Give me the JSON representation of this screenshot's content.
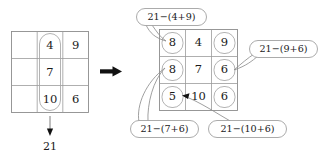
{
  "figure": {
    "target_sum": "21",
    "transition_icon": "right-arrow-icon",
    "colors": {
      "grid_line": "#9a9a9a",
      "oval": "#a5a5a5",
      "bubble": "#9c9c9c",
      "text": "#1a1a1a",
      "arrow": "#111111",
      "background": "#ffffff"
    }
  },
  "left_grid": {
    "rows": 3,
    "cols": 3,
    "cells": [
      [
        "",
        "4",
        "9"
      ],
      [
        "",
        "7",
        ""
      ],
      [
        "",
        "10",
        "6"
      ]
    ],
    "highlight": {
      "shape": "oval",
      "covers": "middle-column",
      "values": [
        "4",
        "7",
        "10"
      ]
    },
    "sum_arrow": {
      "direction": "down",
      "label": "21"
    }
  },
  "right_grid": {
    "rows": 3,
    "cols": 3,
    "cells": [
      [
        "8",
        "4",
        "9"
      ],
      [
        "8",
        "7",
        "6"
      ],
      [
        "5",
        "10",
        "6"
      ]
    ],
    "highlighted_cells": [
      {
        "row": 0,
        "col": 0,
        "value": "8"
      },
      {
        "row": 1,
        "col": 0,
        "value": "8"
      },
      {
        "row": 2,
        "col": 0,
        "value": "5"
      },
      {
        "row": 0,
        "col": 2,
        "value": "9"
      },
      {
        "row": 1,
        "col": 2,
        "value": "6"
      },
      {
        "row": 2,
        "col": 2,
        "value": "6"
      }
    ]
  },
  "callouts": [
    {
      "id": "callout-top-left",
      "text": "21−(4+9)",
      "points_to": "right-grid-cell-r0c0",
      "result": "8"
    },
    {
      "id": "callout-right",
      "text": "21−(9+6)",
      "points_to": "right-grid-cell-r1c2",
      "result": "6"
    },
    {
      "id": "callout-bottom-left",
      "text": "21−(7+6)",
      "points_to": "right-grid-cell-r1c0",
      "result": "8"
    },
    {
      "id": "callout-bottom-right",
      "text": "21−(10+6)",
      "points_to": "right-grid-cell-r2c0",
      "result": "5"
    }
  ]
}
